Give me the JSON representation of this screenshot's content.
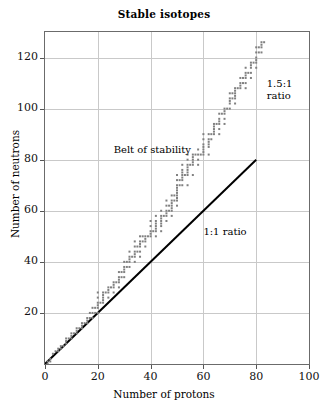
{
  "chart_data": {
    "type": "scatter",
    "title": "Stable isotopes",
    "xlabel": "Number of protons",
    "ylabel": "Number of neutrons",
    "xlim": [
      0,
      100
    ],
    "ylim": [
      0,
      130
    ],
    "xticks": [
      0,
      20,
      40,
      60,
      80,
      100
    ],
    "yticks": [
      0,
      20,
      40,
      60,
      80,
      100,
      120
    ],
    "ytick_labels": [
      "",
      "20",
      "40",
      "60",
      "80",
      "100",
      "120"
    ],
    "grid": true,
    "legend": "none",
    "point_color": "#808080",
    "line_color": "#000000",
    "annotations": [
      {
        "id": "belt",
        "text": "Belt of stability",
        "x": 26,
        "y": 86
      },
      {
        "id": "ratio_15",
        "text": "1.5:1\nratio",
        "x": 84,
        "y": 112
      },
      {
        "id": "ratio_11",
        "text": "1:1 ratio",
        "x": 60,
        "y": 54
      }
    ],
    "reference_lines": [
      {
        "name": "1:1 ratio",
        "x": [
          0,
          80
        ],
        "y": [
          0,
          80
        ],
        "color": "#000000",
        "width": 2
      }
    ],
    "series": [
      {
        "name": "Stable isotopes",
        "marker": "square",
        "marker_size": 2,
        "points": [
          [
            1,
            0
          ],
          [
            1,
            1
          ],
          [
            2,
            1
          ],
          [
            2,
            2
          ],
          [
            3,
            4
          ],
          [
            4,
            5
          ],
          [
            5,
            5
          ],
          [
            5,
            6
          ],
          [
            6,
            6
          ],
          [
            6,
            7
          ],
          [
            7,
            7
          ],
          [
            8,
            8
          ],
          [
            8,
            9
          ],
          [
            8,
            10
          ],
          [
            9,
            10
          ],
          [
            10,
            10
          ],
          [
            10,
            11
          ],
          [
            10,
            12
          ],
          [
            11,
            12
          ],
          [
            12,
            12
          ],
          [
            12,
            13
          ],
          [
            12,
            14
          ],
          [
            13,
            14
          ],
          [
            14,
            14
          ],
          [
            14,
            15
          ],
          [
            14,
            16
          ],
          [
            15,
            16
          ],
          [
            16,
            16
          ],
          [
            16,
            17
          ],
          [
            16,
            18
          ],
          [
            17,
            18
          ],
          [
            17,
            20
          ],
          [
            18,
            18
          ],
          [
            18,
            20
          ],
          [
            18,
            22
          ],
          [
            19,
            20
          ],
          [
            19,
            22
          ],
          [
            20,
            20
          ],
          [
            20,
            22
          ],
          [
            20,
            23
          ],
          [
            20,
            24
          ],
          [
            20,
            26
          ],
          [
            20,
            28
          ],
          [
            21,
            24
          ],
          [
            22,
            24
          ],
          [
            22,
            25
          ],
          [
            22,
            26
          ],
          [
            22,
            27
          ],
          [
            22,
            28
          ],
          [
            23,
            28
          ],
          [
            24,
            26
          ],
          [
            24,
            28
          ],
          [
            24,
            29
          ],
          [
            24,
            30
          ],
          [
            25,
            30
          ],
          [
            26,
            28
          ],
          [
            26,
            30
          ],
          [
            26,
            31
          ],
          [
            26,
            32
          ],
          [
            27,
            32
          ],
          [
            28,
            30
          ],
          [
            28,
            32
          ],
          [
            28,
            33
          ],
          [
            28,
            34
          ],
          [
            28,
            36
          ],
          [
            29,
            34
          ],
          [
            29,
            36
          ],
          [
            30,
            34
          ],
          [
            30,
            36
          ],
          [
            30,
            37
          ],
          [
            30,
            38
          ],
          [
            30,
            40
          ],
          [
            31,
            38
          ],
          [
            31,
            40
          ],
          [
            32,
            38
          ],
          [
            32,
            40
          ],
          [
            32,
            41
          ],
          [
            32,
            42
          ],
          [
            32,
            44
          ],
          [
            33,
            42
          ],
          [
            34,
            40
          ],
          [
            34,
            42
          ],
          [
            34,
            43
          ],
          [
            34,
            44
          ],
          [
            34,
            46
          ],
          [
            34,
            48
          ],
          [
            35,
            44
          ],
          [
            35,
            46
          ],
          [
            36,
            42
          ],
          [
            36,
            44
          ],
          [
            36,
            46
          ],
          [
            36,
            47
          ],
          [
            36,
            48
          ],
          [
            36,
            50
          ],
          [
            37,
            48
          ],
          [
            37,
            50
          ],
          [
            38,
            46
          ],
          [
            38,
            48
          ],
          [
            38,
            49
          ],
          [
            38,
            50
          ],
          [
            39,
            50
          ],
          [
            40,
            50
          ],
          [
            40,
            51
          ],
          [
            40,
            52
          ],
          [
            40,
            54
          ],
          [
            40,
            56
          ],
          [
            41,
            52
          ],
          [
            42,
            50
          ],
          [
            42,
            52
          ],
          [
            42,
            53
          ],
          [
            42,
            54
          ],
          [
            42,
            55
          ],
          [
            42,
            56
          ],
          [
            42,
            58
          ],
          [
            44,
            52
          ],
          [
            44,
            54
          ],
          [
            44,
            55
          ],
          [
            44,
            56
          ],
          [
            44,
            57
          ],
          [
            44,
            58
          ],
          [
            44,
            60
          ],
          [
            45,
            58
          ],
          [
            46,
            56
          ],
          [
            46,
            58
          ],
          [
            46,
            59
          ],
          [
            46,
            60
          ],
          [
            46,
            62
          ],
          [
            46,
            64
          ],
          [
            47,
            60
          ],
          [
            47,
            62
          ],
          [
            48,
            58
          ],
          [
            48,
            60
          ],
          [
            48,
            61
          ],
          [
            48,
            62
          ],
          [
            48,
            63
          ],
          [
            48,
            64
          ],
          [
            48,
            66
          ],
          [
            49,
            64
          ],
          [
            49,
            66
          ],
          [
            50,
            62
          ],
          [
            50,
            64
          ],
          [
            50,
            65
          ],
          [
            50,
            66
          ],
          [
            50,
            67
          ],
          [
            50,
            68
          ],
          [
            50,
            69
          ],
          [
            50,
            70
          ],
          [
            50,
            72
          ],
          [
            50,
            74
          ],
          [
            51,
            70
          ],
          [
            51,
            72
          ],
          [
            52,
            70
          ],
          [
            52,
            72
          ],
          [
            52,
            73
          ],
          [
            52,
            74
          ],
          [
            52,
            75
          ],
          [
            52,
            76
          ],
          [
            52,
            78
          ],
          [
            53,
            74
          ],
          [
            54,
            70
          ],
          [
            54,
            74
          ],
          [
            54,
            75
          ],
          [
            54,
            76
          ],
          [
            54,
            77
          ],
          [
            54,
            78
          ],
          [
            54,
            80
          ],
          [
            54,
            82
          ],
          [
            55,
            78
          ],
          [
            56,
            74
          ],
          [
            56,
            78
          ],
          [
            56,
            79
          ],
          [
            56,
            80
          ],
          [
            56,
            81
          ],
          [
            56,
            82
          ],
          [
            57,
            82
          ],
          [
            58,
            78
          ],
          [
            58,
            80
          ],
          [
            58,
            82
          ],
          [
            58,
            84
          ],
          [
            59,
            82
          ],
          [
            60,
            82
          ],
          [
            60,
            83
          ],
          [
            60,
            84
          ],
          [
            60,
            85
          ],
          [
            60,
            86
          ],
          [
            60,
            88
          ],
          [
            60,
            90
          ],
          [
            62,
            82
          ],
          [
            62,
            85
          ],
          [
            62,
            86
          ],
          [
            62,
            87
          ],
          [
            62,
            88
          ],
          [
            62,
            90
          ],
          [
            63,
            88
          ],
          [
            63,
            90
          ],
          [
            64,
            90
          ],
          [
            64,
            91
          ],
          [
            64,
            92
          ],
          [
            64,
            93
          ],
          [
            64,
            94
          ],
          [
            65,
            94
          ],
          [
            66,
            90
          ],
          [
            66,
            92
          ],
          [
            66,
            94
          ],
          [
            66,
            95
          ],
          [
            66,
            96
          ],
          [
            66,
            98
          ],
          [
            67,
            98
          ],
          [
            68,
            94
          ],
          [
            68,
            96
          ],
          [
            68,
            98
          ],
          [
            68,
            99
          ],
          [
            68,
            100
          ],
          [
            69,
            100
          ],
          [
            70,
            100
          ],
          [
            70,
            102
          ],
          [
            70,
            103
          ],
          [
            70,
            104
          ],
          [
            70,
            106
          ],
          [
            71,
            104
          ],
          [
            71,
            106
          ],
          [
            72,
            102
          ],
          [
            72,
            104
          ],
          [
            72,
            105
          ],
          [
            72,
            106
          ],
          [
            72,
            107
          ],
          [
            72,
            108
          ],
          [
            73,
            108
          ],
          [
            74,
            108
          ],
          [
            74,
            109
          ],
          [
            74,
            110
          ],
          [
            74,
            112
          ],
          [
            75,
            110
          ],
          [
            75,
            112
          ],
          [
            76,
            108
          ],
          [
            76,
            110
          ],
          [
            76,
            112
          ],
          [
            76,
            113
          ],
          [
            76,
            114
          ],
          [
            76,
            116
          ],
          [
            77,
            114
          ],
          [
            78,
            112
          ],
          [
            78,
            114
          ],
          [
            78,
            116
          ],
          [
            78,
            117
          ],
          [
            78,
            118
          ],
          [
            79,
            118
          ],
          [
            80,
            116
          ],
          [
            80,
            118
          ],
          [
            80,
            119
          ],
          [
            80,
            120
          ],
          [
            80,
            122
          ],
          [
            80,
            124
          ],
          [
            81,
            122
          ],
          [
            81,
            124
          ],
          [
            82,
            122
          ],
          [
            82,
            124
          ],
          [
            82,
            125
          ],
          [
            82,
            126
          ],
          [
            83,
            126
          ]
        ]
      }
    ]
  }
}
